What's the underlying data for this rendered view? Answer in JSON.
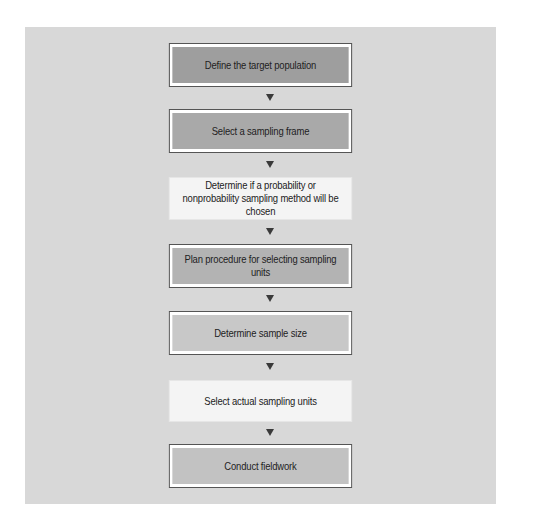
{
  "diagram": {
    "type": "flowchart",
    "direction": "top-to-bottom",
    "panel_color": "#d8d8d8",
    "steps": [
      {
        "label": "Define the target population",
        "fill": "#9e9e9e",
        "style": "outlined",
        "top": 43,
        "height": 44
      },
      {
        "label": "Select a sampling frame",
        "fill": "#a9a9a9",
        "style": "outlined",
        "top": 109,
        "height": 44
      },
      {
        "label": "Determine if a probability or nonprobability sampling method will be chosen",
        "fill": "#f4f4f4",
        "style": "plain",
        "top": 177,
        "height": 43
      },
      {
        "label": "Plan procedure for selecting sampling units",
        "fill": "#b3b3b3",
        "style": "outlined",
        "top": 244,
        "height": 44
      },
      {
        "label": "Determine sample size",
        "fill": "#c8c8c8",
        "style": "outlined",
        "top": 311,
        "height": 44
      },
      {
        "label": "Select actual sampling units",
        "fill": "#f4f4f4",
        "style": "plain",
        "top": 380,
        "height": 42
      },
      {
        "label": "Conduct fieldwork",
        "fill": "#c2c2c2",
        "style": "outlined",
        "top": 444,
        "height": 44
      }
    ],
    "arrows": [
      {
        "from": 0,
        "to": 1,
        "top": 94
      },
      {
        "from": 1,
        "to": 2,
        "top": 161
      },
      {
        "from": 2,
        "to": 3,
        "top": 228
      },
      {
        "from": 3,
        "to": 4,
        "top": 295
      },
      {
        "from": 4,
        "to": 5,
        "top": 363
      },
      {
        "from": 5,
        "to": 6,
        "top": 429
      }
    ],
    "arrow_icon": "down-triangle-icon"
  }
}
